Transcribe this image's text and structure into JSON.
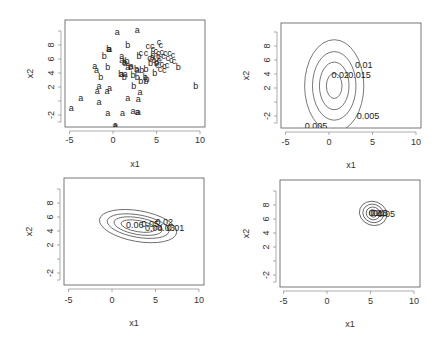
{
  "chart_data": [
    {
      "type": "scatter",
      "panel": "top-left",
      "xlabel": "x1",
      "ylabel": "x2",
      "xticks": [
        -5,
        0,
        5,
        10
      ],
      "yticks": [
        -2,
        2,
        4,
        6,
        8
      ],
      "xlim": [
        -5.5,
        10.5
      ],
      "ylim": [
        -4,
        11
      ],
      "series": [
        {
          "name": "a",
          "points": [
            [
              0.5,
              9.9
            ],
            [
              2.8,
              10.2
            ],
            [
              -0.5,
              7.5
            ],
            [
              -0.4,
              7.5
            ],
            [
              1.0,
              6.5
            ],
            [
              1.0,
              5.8
            ],
            [
              -2.1,
              5.0
            ],
            [
              -1.9,
              4.4
            ],
            [
              1.3,
              5.6
            ],
            [
              1.7,
              4.8
            ],
            [
              2.1,
              5.0
            ],
            [
              1.0,
              3.8
            ],
            [
              1.4,
              3.8
            ],
            [
              -1.6,
              2.1
            ],
            [
              -1.8,
              1.5
            ],
            [
              -0.7,
              1.4
            ],
            [
              -0.4,
              1.9
            ],
            [
              3.1,
              1.3
            ],
            [
              -3.7,
              0.5
            ],
            [
              1.7,
              0.5
            ],
            [
              2.9,
              0.3
            ],
            [
              -4.8,
              -1.0
            ],
            [
              -1.6,
              -0.1
            ],
            [
              -0.6,
              -1.7
            ],
            [
              1.1,
              -1.7
            ],
            [
              2.3,
              -1.4
            ],
            [
              2.8,
              -1.5
            ],
            [
              2.9,
              -1.6
            ],
            [
              0.2,
              -3.6
            ],
            [
              0.3,
              -3.4
            ],
            [
              4.5,
              6.3
            ],
            [
              2.8,
              4.5
            ]
          ]
        },
        {
          "name": "b",
          "points": [
            [
              1.7,
              8.0
            ],
            [
              -0.5,
              7.5
            ],
            [
              -1.0,
              6.5
            ],
            [
              -0.6,
              4.8
            ],
            [
              -1.4,
              3.5
            ],
            [
              0.9,
              3.8
            ],
            [
              1.3,
              3.4
            ],
            [
              1.4,
              5.4
            ],
            [
              2.0,
              4.8
            ],
            [
              2.7,
              4.6
            ],
            [
              3.3,
              4.5
            ],
            [
              3.8,
              4.6
            ],
            [
              2.3,
              3.7
            ],
            [
              2.8,
              3.5
            ],
            [
              3.7,
              3.5
            ],
            [
              3.9,
              3.2
            ],
            [
              3.2,
              2.8
            ],
            [
              2.4,
              2.1
            ],
            [
              4.3,
              5.4
            ],
            [
              5.0,
              5.5
            ],
            [
              4.8,
              4.0
            ],
            [
              3.0,
              6.5
            ],
            [
              4.6,
              6.6
            ],
            [
              7.5,
              4.8
            ],
            [
              9.5,
              2.2
            ],
            [
              1.6,
              5.7
            ],
            [
              3.8,
              2.9
            ]
          ]
        },
        {
          "name": "c",
          "points": [
            [
              4.0,
              7.9
            ],
            [
              4.5,
              7.8
            ],
            [
              5.3,
              8.4
            ],
            [
              5.5,
              8.0
            ],
            [
              3.2,
              6.9
            ],
            [
              4.6,
              7.4
            ],
            [
              4.9,
              7.1
            ],
            [
              5.2,
              6.9
            ],
            [
              5.6,
              7.0
            ],
            [
              6.0,
              6.9
            ],
            [
              6.5,
              6.9
            ],
            [
              6.9,
              6.6
            ],
            [
              5.2,
              6.5
            ],
            [
              5.4,
              6.2
            ],
            [
              5.8,
              6.4
            ],
            [
              6.3,
              6.1
            ],
            [
              6.7,
              5.9
            ],
            [
              7.0,
              5.7
            ],
            [
              4.7,
              5.9
            ],
            [
              5.0,
              5.6
            ],
            [
              5.6,
              5.3
            ],
            [
              5.9,
              5.0
            ],
            [
              6.2,
              5.2
            ],
            [
              5.4,
              4.6
            ],
            [
              5.9,
              4.4
            ],
            [
              3.8,
              6.8
            ],
            [
              4.2,
              6.2
            ],
            [
              5.1,
              5.2
            ],
            [
              5.3,
              5.9
            ]
          ]
        }
      ]
    },
    {
      "type": "contour",
      "panel": "top-right",
      "xlabel": "x1",
      "ylabel": "x2",
      "xticks": [
        -5,
        0,
        5,
        10
      ],
      "yticks": [
        -2,
        2,
        4,
        6,
        8
      ],
      "center": [
        0.6,
        2.3
      ],
      "levels": [
        0.005,
        0.01,
        0.015,
        0.02
      ],
      "ellipses": [
        {
          "rx": 3.4,
          "ry": 6.6
        },
        {
          "rx": 2.5,
          "ry": 4.9
        },
        {
          "rx": 1.7,
          "ry": 3.4
        },
        {
          "rx": 0.9,
          "ry": 1.8
        }
      ],
      "labels": [
        {
          "text": "0.01",
          "x": 3.0,
          "y": 5.3
        },
        {
          "text": "0.015",
          "x": 2.2,
          "y": 3.9
        },
        {
          "text": "0.02",
          "x": 0.3,
          "y": 3.9
        },
        {
          "text": "0.005",
          "x": 3.2,
          "y": -2.0
        },
        {
          "text": "0.005",
          "x": -2.8,
          "y": -3.4
        }
      ]
    },
    {
      "type": "contour",
      "panel": "bottom-left",
      "xlabel": "x1",
      "ylabel": "x2",
      "xticks": [
        -5,
        0,
        5,
        10
      ],
      "yticks": [
        -2,
        2,
        4,
        6,
        8
      ],
      "center": [
        3.0,
        4.7
      ],
      "angle": 10,
      "levels": [
        0.01,
        0.02,
        0.03,
        0.04,
        0.05,
        0.06
      ],
      "ellipses": [
        {
          "rx": 4.5,
          "ry": 2.2
        },
        {
          "rx": 3.6,
          "ry": 1.6
        },
        {
          "rx": 2.8,
          "ry": 1.2
        },
        {
          "rx": 2.0,
          "ry": 0.8
        }
      ],
      "labels": [
        {
          "text": "0.06",
          "x": 1.6,
          "y": 4.9
        },
        {
          "text": "0.05",
          "x": 3.4,
          "y": 5.0
        },
        {
          "text": "0.04",
          "x": 3.8,
          "y": 4.4
        },
        {
          "text": "0.03",
          "x": 5.2,
          "y": 4.4
        },
        {
          "text": "0.02",
          "x": 5.0,
          "y": 5.3
        },
        {
          "text": "0.01",
          "x": 6.3,
          "y": 4.4
        }
      ]
    },
    {
      "type": "contour",
      "panel": "bottom-right",
      "xlabel": "x1",
      "ylabel": "x2",
      "xticks": [
        -5,
        0,
        5,
        10
      ],
      "yticks": [
        -2,
        2,
        4,
        6,
        8
      ],
      "center": [
        5.3,
        6.8
      ],
      "angle": 20,
      "levels": [
        0.05,
        0.1,
        0.15,
        0.2
      ],
      "ellipses": [
        {
          "rx": 1.6,
          "ry": 1.7
        },
        {
          "rx": 1.2,
          "ry": 1.3
        },
        {
          "rx": 0.8,
          "ry": 0.9
        },
        {
          "rx": 0.45,
          "ry": 0.5
        }
      ],
      "labels": [
        {
          "text": "0.2",
          "x": 4.8,
          "y": 6.9
        },
        {
          "text": "0.15",
          "x": 5.0,
          "y": 6.9
        },
        {
          "text": "0.1",
          "x": 5.3,
          "y": 6.9
        },
        {
          "text": "0.05",
          "x": 5.8,
          "y": 6.7
        }
      ]
    }
  ]
}
